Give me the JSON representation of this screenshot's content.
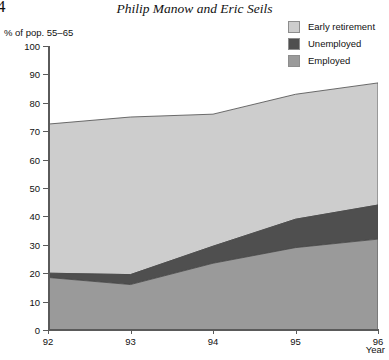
{
  "page": {
    "folio": "4",
    "running_head": "Philip Manow and Eric Seils"
  },
  "legend": {
    "items": [
      {
        "label": "Early retirement",
        "color": "#cdcdcd",
        "key": "early_retirement"
      },
      {
        "label": "Unemployed",
        "color": "#4f4f4f",
        "key": "unemployed"
      },
      {
        "label": "Employed",
        "color": "#9a9a9a",
        "key": "employed"
      }
    ]
  },
  "chart_data": {
    "type": "area",
    "stacked": true,
    "title": "",
    "xlabel": "Year",
    "ylabel": "% of pop. 55–65",
    "x": [
      "92",
      "93",
      "94",
      "95",
      "96"
    ],
    "categories": [
      "92",
      "93",
      "94",
      "95",
      "96"
    ],
    "xlim": [
      92,
      96
    ],
    "ylim": [
      0,
      100
    ],
    "ytick_labels": [
      "0",
      "10",
      "20",
      "30",
      "40",
      "50",
      "60",
      "70",
      "80",
      "90",
      "100"
    ],
    "ytick_values": [
      0,
      10,
      20,
      30,
      40,
      50,
      60,
      70,
      80,
      90,
      100
    ],
    "xtick_labels": [
      "92",
      "93",
      "94",
      "95",
      "96"
    ],
    "grid": false,
    "legend_position": "top-right",
    "series": [
      {
        "name": "Employed",
        "color": "#9a9a9a",
        "values": [
          18.5,
          16.0,
          23.5,
          29.0,
          32.0
        ]
      },
      {
        "name": "Unemployed",
        "color": "#4f4f4f",
        "values": [
          1.5,
          3.5,
          6.0,
          10.0,
          12.0
        ]
      },
      {
        "name": "Early retirement",
        "color": "#cdcdcd",
        "values": [
          52.5,
          55.5,
          46.5,
          44.0,
          43.0
        ]
      }
    ],
    "cumulative_tops": {
      "employed": [
        18.5,
        16.0,
        23.5,
        29.0,
        32.0
      ],
      "unemployed": [
        20.0,
        19.5,
        29.5,
        39.0,
        44.0
      ],
      "early_retirement": [
        72.5,
        75.0,
        76.0,
        83.0,
        87.0
      ]
    }
  }
}
